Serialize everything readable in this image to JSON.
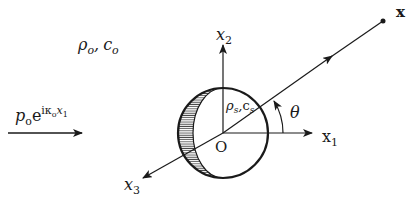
{
  "figure": {
    "type": "acoustic-scattering-sphere",
    "colors": {
      "ink": "#1a1a1a",
      "hatch": "#555555",
      "background": "#ffffff"
    }
  },
  "labels": {
    "medium_density": "ρ",
    "medium_density_sub": "o",
    "medium_sep": ",",
    "medium_speed": "c",
    "medium_speed_sub": "o",
    "incident_p": "p",
    "incident_p_sub": "o",
    "incident_e": "e",
    "incident_exp": "iκ",
    "incident_exp_sub": "o",
    "incident_exp_x": "x",
    "incident_exp_x_sub": "1",
    "sphere_density": "ρ",
    "sphere_density_sub": "s",
    "sphere_sep": ",",
    "sphere_speed": "c",
    "sphere_speed_sub": "s",
    "origin": "O",
    "axis_x1": "x",
    "axis_x1_sub": "1",
    "axis_x2": "x",
    "axis_x2_sub": "2",
    "axis_x3": "x",
    "axis_x3_sub": "3",
    "angle": "θ",
    "field_point": "x"
  }
}
